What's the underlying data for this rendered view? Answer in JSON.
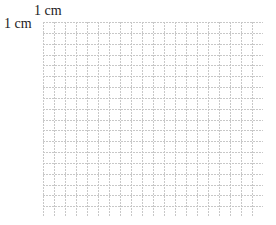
{
  "diagram": {
    "type": "square-grid",
    "scale_labels": {
      "horizontal": "1 cm",
      "vertical": "1 cm"
    },
    "grid": {
      "columns": 20,
      "rows": 18,
      "cell_unit": "1 cm",
      "line_color": "#c8c8c8",
      "line_style": "dashed"
    }
  }
}
